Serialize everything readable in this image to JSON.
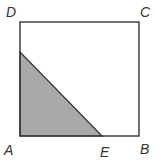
{
  "diagram": {
    "type": "geometry-square-with-shaded-triangle",
    "square": {
      "vertices": [
        "A",
        "B",
        "C",
        "D"
      ],
      "stroke": "#333333",
      "fill": "#ffffff"
    },
    "shaded_triangle": {
      "vertices": [
        "A",
        "E",
        "point on AD"
      ],
      "fill": "#a9a9a9",
      "stroke": "#333333"
    },
    "labels": {
      "A": "A",
      "B": "B",
      "C": "C",
      "D": "D",
      "E": "E"
    }
  }
}
